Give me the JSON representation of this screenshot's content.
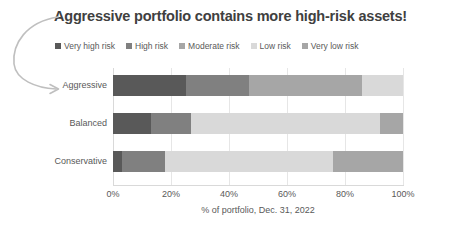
{
  "title": "Aggressive portfolio contains more high-risk assets!",
  "annotation": {
    "name": "curved-arrow-to-aggressive"
  },
  "legend": {
    "position": "top",
    "items": [
      {
        "label": "Very high risk",
        "color": "#595959"
      },
      {
        "label": "High risk",
        "color": "#808080"
      },
      {
        "label": "Moderate risk",
        "color": "#A6A6A6"
      },
      {
        "label": "Low risk",
        "color": "#D9D9D9"
      },
      {
        "label": "Very low risk",
        "color": "#A6A6A6"
      }
    ]
  },
  "chart_data": {
    "type": "bar",
    "orientation": "horizontal",
    "stacked": true,
    "title": "Aggressive portfolio contains more high-risk assets!",
    "xlabel": "% of portfolio, Dec. 31, 2022",
    "ylabel": "",
    "xlim": [
      0,
      100
    ],
    "xticks": [
      0,
      20,
      40,
      60,
      80,
      100
    ],
    "xticklabels": [
      "0%",
      "20%",
      "40%",
      "60%",
      "80%",
      "100%"
    ],
    "grid": true,
    "legend_position": "top",
    "categories": [
      "Aggressive",
      "Balanced",
      "Conservative"
    ],
    "series": [
      {
        "name": "Very high risk",
        "color": "#595959",
        "values": [
          25,
          13,
          3
        ]
      },
      {
        "name": "High risk",
        "color": "#808080",
        "values": [
          22,
          14,
          15
        ]
      },
      {
        "name": "Moderate risk",
        "color": "#A6A6A6",
        "values": [
          39,
          0,
          0
        ]
      },
      {
        "name": "Low risk",
        "color": "#D9D9D9",
        "values": [
          14,
          65,
          58
        ]
      },
      {
        "name": "Very low risk",
        "color": "#A6A6A6",
        "values": [
          0,
          8,
          24
        ]
      }
    ]
  }
}
